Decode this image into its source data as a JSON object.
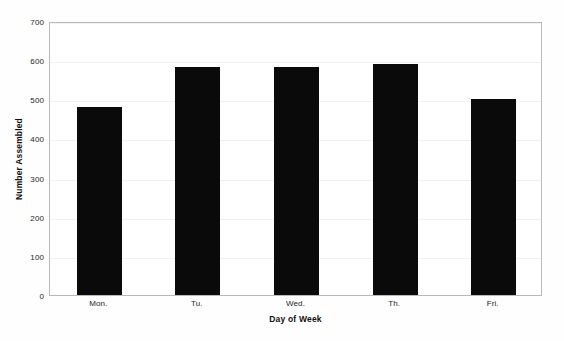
{
  "chart_data": {
    "type": "bar",
    "title": "",
    "subtitle": "",
    "xlabel": "Day of Week",
    "ylabel": "Number Assembled",
    "categories": [
      "Mon.",
      "Tu.",
      "Wed.",
      "Th.",
      "Fri."
    ],
    "values": [
      480,
      582,
      582,
      590,
      500
    ],
    "ylim": [
      0,
      700
    ],
    "ytick_labels": [
      "0",
      "100",
      "200",
      "300",
      "400",
      "500",
      "600",
      "700"
    ],
    "ytick_values": [
      0,
      100,
      200,
      300,
      400,
      500,
      600,
      700
    ],
    "grid": true,
    "legend": "none",
    "bar_color": "#0a0a0a",
    "frame_color": "#b9b9b9",
    "background_color": "#ffffff",
    "text_color": "#1d1d1d"
  }
}
